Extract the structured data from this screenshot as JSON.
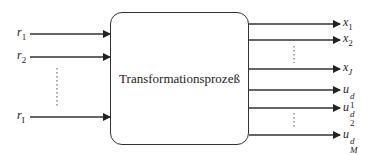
{
  "diagram": {
    "type": "block-diagram",
    "process_label": "Transformationsprozeß",
    "inputs": [
      {
        "var": "r",
        "sub": "1",
        "y": 34
      },
      {
        "var": "r",
        "sub": "2",
        "y": 57
      },
      {
        "var": "r",
        "sub": "I",
        "y": 117
      }
    ],
    "outputs": [
      {
        "var": "x",
        "sub": "1",
        "sup": "",
        "y": 24
      },
      {
        "var": "x",
        "sub": "2",
        "sup": "",
        "y": 40
      },
      {
        "var": "x",
        "sub": "J",
        "sup": "",
        "y": 69
      },
      {
        "var": "u",
        "sub": "1",
        "sup": "d",
        "y": 90
      },
      {
        "var": "u",
        "sub": "2",
        "sup": "d",
        "y": 108
      },
      {
        "var": "u",
        "sub": "M",
        "sup": "d",
        "y": 135
      }
    ],
    "ellipses": [
      "input-ellipsis",
      "output-x-ellipsis",
      "output-u-ellipsis"
    ],
    "colors": {
      "stroke": "#333333",
      "text": "#222222",
      "background": "#ffffff"
    }
  }
}
